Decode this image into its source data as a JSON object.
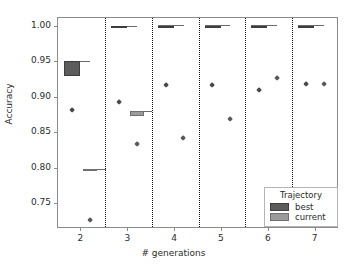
{
  "chart_data": {
    "type": "box",
    "title": "",
    "xlabel": "# generations",
    "ylabel": "Accuracy",
    "categories": [
      "2",
      "3",
      "4",
      "5",
      "6",
      "7"
    ],
    "xtick_labels": [
      "2",
      "3",
      "4",
      "5",
      "6",
      "7"
    ],
    "ytick_labels": [
      "1.00",
      "0.95",
      "0.90",
      "0.85",
      "0.80",
      "0.75"
    ],
    "ylim": [
      0.715,
      1.012
    ],
    "xlim": [
      1.5,
      7.5
    ],
    "grid": false,
    "legend": {
      "title": "Trajectory",
      "position": "lower right",
      "entries": [
        {
          "label": "best",
          "color": "#5c5c5c"
        },
        {
          "label": "current",
          "color": "#9b9b9b"
        }
      ]
    },
    "panel_separators": [
      2.5,
      3.5,
      4.5,
      5.5,
      6.5
    ],
    "series": [
      {
        "name": "best",
        "color": "#5c5c5c",
        "boxes": [
          {
            "generation": 2,
            "x": 1.8,
            "median": 0.941,
            "q1": 0.931,
            "q3": 0.952,
            "whisker_low": 0.931,
            "whisker_high": 0.952,
            "width": 0.34
          },
          {
            "generation": 3,
            "x": 2.8,
            "median": 1.0,
            "q1": 0.999,
            "q3": 1.001,
            "whisker_low": 0.999,
            "whisker_high": 1.001,
            "width": 0.34
          },
          {
            "generation": 4,
            "x": 3.8,
            "median": 1.0,
            "q1": 0.999,
            "q3": 1.001,
            "whisker_low": 0.999,
            "whisker_high": 1.002,
            "width": 0.34
          },
          {
            "generation": 5,
            "x": 4.8,
            "median": 1.0,
            "q1": 0.999,
            "q3": 1.001,
            "whisker_low": 0.999,
            "whisker_high": 1.002,
            "width": 0.34
          },
          {
            "generation": 6,
            "x": 5.8,
            "median": 1.0,
            "q1": 0.999,
            "q3": 1.001,
            "whisker_low": 0.999,
            "whisker_high": 1.002,
            "width": 0.34
          },
          {
            "generation": 7,
            "x": 6.8,
            "median": 1.0,
            "q1": 0.999,
            "q3": 1.001,
            "whisker_low": 0.999,
            "whisker_high": 1.002,
            "width": 0.34
          }
        ],
        "outliers": [
          {
            "generation": 2,
            "x": 1.8,
            "y": 0.883
          },
          {
            "generation": 3,
            "x": 2.8,
            "y": 0.893
          },
          {
            "generation": 4,
            "x": 3.8,
            "y": 0.918
          },
          {
            "generation": 5,
            "x": 4.8,
            "y": 0.918
          },
          {
            "generation": 6,
            "x": 5.8,
            "y": 0.91
          },
          {
            "generation": 7,
            "x": 6.8,
            "y": 0.919
          }
        ]
      },
      {
        "name": "current",
        "color": "#9b9b9b",
        "boxes": [
          {
            "generation": 2,
            "x": 2.18,
            "median": 0.798,
            "q1": 0.796,
            "q3": 0.8,
            "whisker_low": 0.796,
            "whisker_high": 0.8,
            "width": 0.3
          },
          {
            "generation": 3,
            "x": 3.18,
            "median": 0.878,
            "q1": 0.874,
            "q3": 0.881,
            "whisker_low": 0.874,
            "whisker_high": 0.881,
            "width": 0.3
          }
        ],
        "outliers": [
          {
            "generation": 2,
            "x": 2.18,
            "y": 0.727
          },
          {
            "generation": 3,
            "x": 3.18,
            "y": 0.835
          },
          {
            "generation": 4,
            "x": 4.18,
            "y": 0.843
          },
          {
            "generation": 5,
            "x": 5.18,
            "y": 0.869
          },
          {
            "generation": 6,
            "x": 6.18,
            "y": 0.927
          },
          {
            "generation": 7,
            "x": 7.18,
            "y": 0.919
          }
        ]
      }
    ]
  }
}
